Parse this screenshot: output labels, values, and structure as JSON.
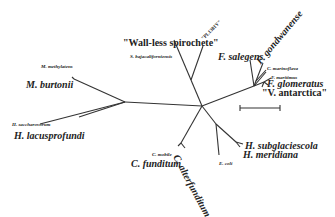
{
  "tree": {
    "type": "unrooted phylogenetic tree",
    "taxa": {
      "wall_less": "\"Wall-less spirochete\"",
      "plimy": "\"PL1381Y\"",
      "s_baja": "S. bajacaliforniensis",
      "f_salegens": "F. salegens",
      "f_gond": "F. gondwanense",
      "c_marino": "C. marinoflava",
      "f_maritimus": "F. maritimus",
      "f_glom": "F. glomeratus",
      "v_antarctica": "\"V. antarctica\"",
      "m_methyl": "M. methylatens",
      "m_burtonii": "M. burtonii",
      "h_sacch": "H. saccharovorum",
      "h_lacus": "H. lacusprofundi",
      "h_subglac": "H. subglaciescola",
      "h_merid": "H. meridiana",
      "e_coli": "E. coli",
      "c_mobile": "C. mobile",
      "c_funditum": "C. funditum",
      "c_alterfunditum": "C. alterfunditum"
    },
    "scale_bar": {
      "present": true
    }
  }
}
